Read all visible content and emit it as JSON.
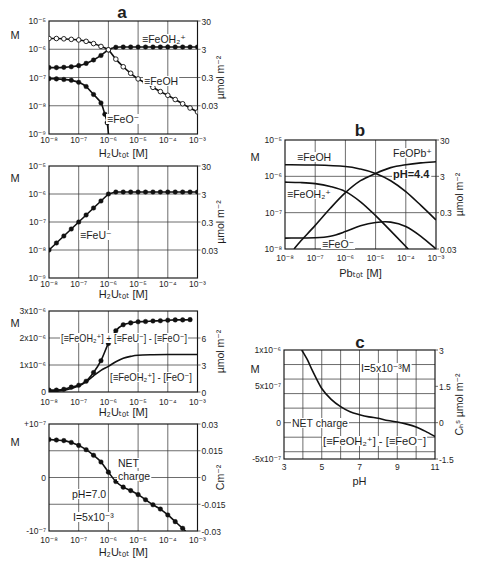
{
  "figure": {
    "panel_letters": [
      "a",
      "b",
      "c"
    ]
  },
  "chart_data": [
    {
      "id": "a1",
      "panel": "a",
      "title": "a",
      "type": "line",
      "xscale": "log",
      "yscale": "log",
      "xlim_log10": [
        -8,
        -3
      ],
      "ylim_log10": [
        -9,
        -5
      ],
      "xlabel": "H₂Uₜₒₜ [M]",
      "ylabel": "M",
      "ylabel_right": "µmol m⁻²",
      "xticks": [
        -8,
        -7,
        -6,
        -5,
        -4,
        -3
      ],
      "xtick_labels": [
        "10⁻⁸",
        "10⁻⁷",
        "10⁻⁶",
        "10⁻⁵",
        "10⁻⁴",
        "10⁻³"
      ],
      "yticks": [
        -9,
        -8,
        -7,
        -6,
        -5
      ],
      "ytick_labels": [
        "10⁻⁹",
        "10⁻⁸",
        "10⁻⁷",
        "10⁻⁶",
        "10⁻⁵"
      ],
      "yticks_right": [
        -8,
        -7,
        -6,
        -5
      ],
      "ytick_right_labels": [
        "0.03",
        "0.3",
        "3",
        "30"
      ],
      "xgrid": [
        -7,
        -6,
        -5,
        -4
      ],
      "ygrid": [
        -8,
        -7,
        -6
      ],
      "series": [
        {
          "name": "≡FeOH₂⁺",
          "marker": "filled",
          "smooth": true,
          "x": [
            -8,
            -7.75,
            -7.5,
            -7.25,
            -7,
            -6.75,
            -6.5,
            -6.25,
            -6,
            -5.75,
            -5.5,
            -5.25,
            -5,
            -4.75,
            -4.5,
            -4.25,
            -4,
            -3.75,
            -3.5,
            -3.25,
            -3
          ],
          "y": [
            -6.65,
            -6.65,
            -6.64,
            -6.62,
            -6.58,
            -6.5,
            -6.38,
            -6.22,
            -6.02,
            -5.93,
            -5.92,
            -5.92,
            -5.92,
            -5.92,
            -5.92,
            -5.92,
            -5.92,
            -5.92,
            -5.92,
            -5.92,
            -5.92
          ]
        },
        {
          "name": "≡FeOH",
          "marker": "open",
          "smooth": true,
          "x": [
            -8,
            -7.75,
            -7.5,
            -7.25,
            -7,
            -6.75,
            -6.5,
            -6.25,
            -6,
            -5.75,
            -5.5,
            -5.25,
            -5,
            -4.75,
            -4.5,
            -4.25,
            -4,
            -3.75,
            -3.5,
            -3.25,
            -3
          ],
          "y": [
            -5.62,
            -5.62,
            -5.63,
            -5.65,
            -5.67,
            -5.72,
            -5.8,
            -5.9,
            -6.02,
            -6.35,
            -6.62,
            -6.85,
            -7.05,
            -7.2,
            -7.35,
            -7.5,
            -7.63,
            -7.78,
            -7.93,
            -8.08,
            -8.22
          ]
        },
        {
          "name": "≡FeO⁻",
          "marker": "filled",
          "smooth": true,
          "markers_until": 10,
          "x": [
            -8,
            -7.75,
            -7.5,
            -7.25,
            -7,
            -6.75,
            -6.5,
            -6.25,
            -6.12,
            -6.04,
            -5.99
          ],
          "y": [
            -7.04,
            -7.05,
            -7.07,
            -7.1,
            -7.17,
            -7.32,
            -7.6,
            -7.9,
            -8.3,
            -8.6,
            -9.1
          ]
        }
      ],
      "annotations": [
        {
          "text": "≡FeOH₂⁺",
          "x": 142,
          "y": 43
        },
        {
          "text": "≡FeOH",
          "x": 144,
          "y": 85
        },
        {
          "text": "≡FeO⁻",
          "x": 107,
          "y": 123
        }
      ]
    },
    {
      "id": "a2",
      "panel": "a",
      "title": "",
      "type": "line",
      "xscale": "log",
      "yscale": "log",
      "xlim_log10": [
        -8,
        -3
      ],
      "ylim_log10": [
        -9,
        -5
      ],
      "xlabel": "H₂Uₜₒₜ [M]",
      "ylabel": "M",
      "ylabel_right": "µmol m⁻²",
      "xticks": [
        -8,
        -7,
        -6,
        -5,
        -4,
        -3
      ],
      "xtick_labels": [
        "10⁻⁸",
        "10⁻⁷",
        "10⁻⁶",
        "10⁻⁵",
        "10⁻⁴",
        "10⁻³"
      ],
      "yticks": [
        -9,
        -8,
        -7,
        -6,
        -5
      ],
      "ytick_labels": [
        "10⁻⁹",
        "10⁻⁸",
        "10⁻⁷",
        "10⁻⁶",
        "10⁻⁵"
      ],
      "yticks_right": [
        -8,
        -7,
        -6,
        -5
      ],
      "ytick_right_labels": [
        "0.03",
        "0.3",
        "3",
        "30"
      ],
      "xgrid": [
        -7,
        -6,
        -5,
        -4
      ],
      "ygrid": [
        -8,
        -7,
        -6
      ],
      "series": [
        {
          "name": "≡FeU⁻",
          "marker": "filled",
          "smooth": false,
          "x": [
            -8,
            -7.75,
            -7.5,
            -7.25,
            -7,
            -6.75,
            -6.5,
            -6.25,
            -6,
            -5.75,
            -5.5,
            -5.25,
            -5,
            -4.75,
            -4.5,
            -4.25,
            -4,
            -3.75,
            -3.5,
            -3.25,
            -3
          ],
          "y": [
            -8,
            -7.75,
            -7.5,
            -7.25,
            -7,
            -6.75,
            -6.5,
            -6.25,
            -6,
            -5.93,
            -5.93,
            -5.93,
            -5.93,
            -5.93,
            -5.93,
            -5.93,
            -5.93,
            -5.93,
            -5.93,
            -5.93,
            -5.93
          ]
        }
      ],
      "annotations": [
        {
          "text": "≡FeU⁻",
          "x": 80,
          "y": 239
        }
      ]
    },
    {
      "id": "a3",
      "panel": "a",
      "title": "",
      "type": "line",
      "xscale": "log",
      "yscale": "linear",
      "y_units": "×10⁻⁶ M",
      "xlim_log10": [
        -8,
        -3
      ],
      "ylim": [
        0,
        3
      ],
      "xlabel": "H₂Uₜₒₜ [M]",
      "ylabel": "M",
      "ylabel_right": "µmol m⁻²",
      "xticks": [
        -8,
        -7,
        -6,
        -5,
        -4,
        -3
      ],
      "xtick_labels": [
        "10⁻⁸",
        "10⁻⁷",
        "10⁻⁶",
        "10⁻⁵",
        "10⁻⁴",
        "10⁻³"
      ],
      "yticks": [
        0,
        1,
        2,
        3
      ],
      "ytick_labels": [
        "0",
        "1x10⁻⁶",
        "2x10⁻⁶",
        "3x10⁻⁶"
      ],
      "yticks_right": [
        0,
        1,
        2
      ],
      "ytick_right_labels": [
        "0",
        "3",
        "6"
      ],
      "xgrid": [
        -7,
        -6,
        -5,
        -4
      ],
      "ygrid": [
        1,
        2
      ],
      "series": [
        {
          "name": "[≡FeOH₂⁺] + [≡FeU⁻] - [≡FeO⁻]",
          "marker": "filled",
          "smooth": true,
          "x": [
            -8,
            -7.75,
            -7.5,
            -7.25,
            -7,
            -6.75,
            -6.5,
            -6.25,
            -6,
            -5.75,
            -5.5,
            -5.25,
            -5,
            -4.75,
            -4.5,
            -4.25,
            -4,
            -3.75,
            -3.5,
            -3.25
          ],
          "y": [
            0.07,
            0.07,
            0.1,
            0.18,
            0.25,
            0.4,
            0.72,
            1.16,
            1.8,
            2.27,
            2.49,
            2.56,
            2.6,
            2.61,
            2.63,
            2.64,
            2.66,
            2.67,
            2.67,
            2.68
          ]
        },
        {
          "name": "[≡FeOH₂⁺] - [FeO⁻]",
          "marker": "none",
          "smooth": true,
          "x": [
            -8,
            -7.5,
            -7,
            -6.75,
            -6.5,
            -6.25,
            -6,
            -5.75,
            -5.5,
            -5.25,
            -5,
            -4.5,
            -4,
            -3.5,
            -3
          ],
          "y": [
            0.03,
            0.06,
            0.22,
            0.38,
            0.6,
            0.8,
            0.95,
            1.12,
            1.25,
            1.32,
            1.36,
            1.38,
            1.39,
            1.39,
            1.39
          ]
        }
      ],
      "annotations": [
        {
          "text": "[≡FeOH₂⁺] + [≡FeU⁻] - [≡FeO⁻]",
          "x": 61,
          "y": 342,
          "fit_width": 126
        },
        {
          "text": "[≡FeOH₂⁺] - [FeO⁻]",
          "x": 110,
          "y": 381,
          "fit_width": 82
        }
      ]
    },
    {
      "id": "a4",
      "panel": "a",
      "title": "",
      "type": "line",
      "xscale": "log",
      "yscale": "linear",
      "y_units": "×10⁻⁷ M",
      "xlim_log10": [
        -8,
        -3
      ],
      "ylim": [
        -1,
        1
      ],
      "xlabel": "H₂Uₜₒₜ [M]",
      "ylabel": "M",
      "ylabel_right": "Cm⁻²",
      "xticks": [
        -8,
        -7,
        -6,
        -5,
        -4,
        -3
      ],
      "xtick_labels": [
        "10⁻⁸",
        "10⁻⁷",
        "10⁻⁶",
        "10⁻⁵",
        "10⁻⁴",
        "10⁻³"
      ],
      "yticks": [
        -1,
        0,
        1
      ],
      "ytick_labels": [
        "-10⁻⁷",
        "0",
        "+10⁻⁷"
      ],
      "yticks_right": [
        -1,
        -0.5,
        0,
        0.5,
        1
      ],
      "ytick_right_labels": [
        "-0.03",
        "-0.015",
        "0",
        "0.015",
        "0.03"
      ],
      "xgrid": [
        -7,
        -6,
        -5,
        -4
      ],
      "ygrid": [
        -0.5,
        0,
        0.5
      ],
      "series": [
        {
          "name": "NET charge",
          "marker": "filled",
          "smooth": true,
          "markers_until": 19,
          "x": [
            -8,
            -7.75,
            -7.5,
            -7.25,
            -7,
            -6.75,
            -6.5,
            -6.25,
            -6,
            -5.75,
            -5.5,
            -5.25,
            -5,
            -4.75,
            -4.5,
            -4.25,
            -4,
            -3.75,
            -3.5,
            -3.4
          ],
          "y": [
            0.71,
            0.7,
            0.69,
            0.655,
            0.6,
            0.52,
            0.415,
            0.29,
            0.1,
            -0.075,
            -0.18,
            -0.245,
            -0.32,
            -0.415,
            -0.51,
            -0.59,
            -0.7,
            -0.825,
            -0.95,
            -1.0
          ]
        }
      ],
      "annotations": [
        {
          "text": "NET",
          "x": 118,
          "y": 467
        },
        {
          "text": "charge",
          "x": 118,
          "y": 480
        },
        {
          "text": "pH=7.0",
          "x": 72,
          "y": 498
        },
        {
          "text": "I=5x10⁻³",
          "x": 73,
          "y": 521
        }
      ]
    },
    {
      "id": "b",
      "panel": "b",
      "title": "b",
      "type": "line",
      "xscale": "log",
      "yscale": "log",
      "xlim_log10": [
        -8,
        -3
      ],
      "ylim_log10": [
        -8,
        -5
      ],
      "xlabel": "Pbₜₒₜ [M]",
      "ylabel": "M",
      "ylabel_right": "µmol m⁻²",
      "xticks": [
        -8,
        -7,
        -6,
        -5,
        -4,
        -3
      ],
      "xtick_labels": [
        "10⁻⁸",
        "10⁻⁷",
        "10⁻⁶",
        "10⁻⁵",
        "10⁻⁴",
        "10⁻³"
      ],
      "yticks": [
        -8,
        -7,
        -6,
        -5
      ],
      "ytick_labels": [
        "10⁻⁸",
        "10⁻⁷",
        "10⁻⁶",
        "10⁻⁵"
      ],
      "yticks_right": [
        -8,
        -7,
        -6,
        -5
      ],
      "ytick_right_labels": [
        "0.03",
        "0.3",
        "3",
        "30"
      ],
      "xgrid": [
        -7,
        -6,
        -5,
        -4
      ],
      "ygrid": [
        -7,
        -6
      ],
      "series": [
        {
          "name": "≡FeOH",
          "marker": "none",
          "smooth": true,
          "x": [
            -8,
            -7,
            -6,
            -5.5,
            -5,
            -4.5,
            -4,
            -3.5,
            -3
          ],
          "y": [
            -5.68,
            -5.69,
            -5.73,
            -5.8,
            -5.92,
            -6.12,
            -6.42,
            -6.8,
            -7.2
          ]
        },
        {
          "name": "≡FeOH₂⁺",
          "marker": "none",
          "smooth": true,
          "x": [
            -8,
            -7.5,
            -7,
            -6.5,
            -6,
            -5.5,
            -5,
            -4.5,
            -4,
            -3.92
          ],
          "y": [
            -6.16,
            -6.17,
            -6.2,
            -6.28,
            -6.42,
            -6.7,
            -7.08,
            -7.5,
            -7.93,
            -8
          ]
        },
        {
          "name": "FeOPb⁺",
          "marker": "none",
          "smooth": true,
          "x": [
            -7.7,
            -7.5,
            -7,
            -6.5,
            -6,
            -5.5,
            -5,
            -4.5,
            -4,
            -3.5,
            -3
          ],
          "y": [
            -8,
            -7.8,
            -7.35,
            -6.88,
            -6.45,
            -6.12,
            -5.92,
            -5.76,
            -5.68,
            -5.63,
            -5.6
          ]
        },
        {
          "name": "≡FeO⁻",
          "marker": "none",
          "smooth": true,
          "x": [
            -8,
            -7,
            -6.5,
            -6,
            -5.5,
            -5,
            -4.5,
            -4,
            -3.5,
            -3
          ],
          "y": [
            -7.7,
            -7.69,
            -7.65,
            -7.52,
            -7.36,
            -7.27,
            -7.26,
            -7.38,
            -7.65,
            -8
          ]
        }
      ],
      "annotations": [
        {
          "text": "≡FeOH",
          "x": 297,
          "y": 161
        },
        {
          "text": "FeOPb⁺",
          "x": 393,
          "y": 157
        },
        {
          "text": "pH=4.4",
          "x": 393,
          "y": 178,
          "bold": true
        },
        {
          "text": "≡FeOH₂⁺",
          "x": 287,
          "y": 198
        },
        {
          "text": "≡FeO⁻",
          "x": 322,
          "y": 248
        }
      ]
    },
    {
      "id": "c",
      "panel": "c",
      "title": "c",
      "type": "line",
      "xscale": "linear",
      "yscale": "linear",
      "y_units": "×10⁻⁶ M",
      "xlim": [
        3,
        11
      ],
      "ylim": [
        -0.5,
        1.0
      ],
      "xlabel": "pH",
      "ylabel": "M",
      "ylabel_right": "Cₕˢ µmol m⁻²",
      "xticks": [
        3,
        5,
        7,
        9,
        11
      ],
      "xtick_labels": [
        "3",
        "5",
        "7",
        "9",
        "11"
      ],
      "yticks": [
        -0.5,
        0,
        0.5,
        1.0
      ],
      "ytick_labels": [
        "-5x10⁻⁷",
        "0",
        "5x10⁻⁷",
        "1x10⁻⁶"
      ],
      "yticks_right": [
        -0.5,
        0,
        0.5,
        1.0
      ],
      "ytick_right_labels": [
        "-1.5",
        "0",
        "1.5",
        "3"
      ],
      "xgrid": [
        4,
        5,
        6,
        7,
        8,
        9,
        10
      ],
      "ygrid": [
        -0.4,
        -0.2,
        0,
        0.2,
        0.4,
        0.6,
        0.8
      ],
      "series": [
        {
          "name": "NET charge",
          "marker": "none",
          "smooth": true,
          "x": [
            3.94,
            4.25,
            4.5,
            5,
            5.5,
            6,
            6.5,
            7,
            7.5,
            8,
            8.5,
            9,
            9.5,
            10,
            10.5,
            11
          ],
          "y": [
            1.0,
            0.86,
            0.72,
            0.47,
            0.32,
            0.22,
            0.15,
            0.11,
            0.08,
            0.06,
            0.03,
            0.01,
            -0.02,
            -0.06,
            -0.12,
            -0.19
          ]
        }
      ],
      "annotations": [
        {
          "text": "I=5x10⁻³M",
          "x": 361,
          "y": 372
        },
        {
          "text": "NET charge",
          "x": 292,
          "y": 427
        },
        {
          "text": "[≡FeOH₂⁺] - [≡FeO⁻]",
          "x": 323,
          "y": 445,
          "fit_width": 103
        }
      ]
    }
  ]
}
